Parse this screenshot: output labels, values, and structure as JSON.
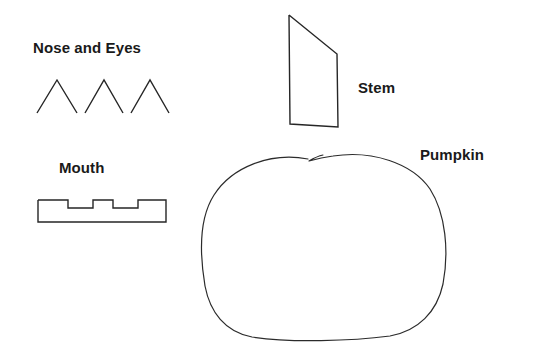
{
  "figure": {
    "background_color": "#ffffff",
    "stroke_color": "#262626",
    "text_color": "#1a1a1a",
    "width": 537,
    "height": 357
  },
  "labels": {
    "nose_and_eyes": "Nose and Eyes",
    "mouth": "Mouth",
    "stem": "Stem",
    "pumpkin": "Pumpkin"
  },
  "shapes": {
    "triangles": [
      {
        "name": "triangle-1",
        "points": "37,113 57,80 77,113"
      },
      {
        "name": "triangle-2",
        "points": "85,113 104,80 123,113"
      },
      {
        "name": "triangle-3",
        "points": "131,113 150,80 169,113"
      }
    ],
    "mouth": {
      "name": "mouth-shape",
      "points": "38,200 68,200 68,208 93,208 93,200 113,200 113,208 138,208 138,200 166,200 166,222 38,222 38,200"
    },
    "stem": {
      "name": "stem-shape",
      "points": "289,15 337,54 338,127 290,124 289,15"
    },
    "pumpkin": {
      "name": "pumpkin-outline",
      "path": "M 308,159 C 270,152 232,167 214,195 C 198,220 200,256 205,286 C 210,312 225,332 252,337 C 290,343 352,341 390,336 C 418,331 437,312 443,284 C 449,252 446,214 430,189 C 412,163 372,150 333,156 C 325,157 316,159 309,161 C 314,158 318,156 323,155"
    }
  }
}
